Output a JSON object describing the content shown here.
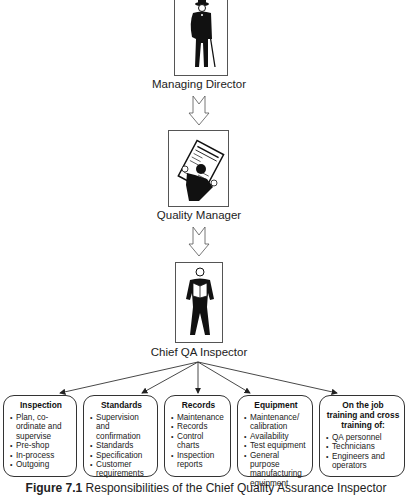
{
  "diagram": {
    "type": "organizational-hierarchy",
    "roles": [
      {
        "id": "managing-director",
        "label": "Managing Director",
        "icon": "man-with-cane-icon"
      },
      {
        "id": "quality-manager",
        "label": "Quality Manager",
        "icon": "man-reading-newspaper-icon"
      },
      {
        "id": "chief-qa-inspector",
        "label": "Chief QA Inspector",
        "icon": "man-reading-book-icon"
      }
    ],
    "responsibilities": [
      {
        "title": "Inspection",
        "items": [
          "Plan, co-ordinate and supervise",
          "Pre-shop",
          "In-process",
          "Outgoing"
        ]
      },
      {
        "title": "Standards",
        "items": [
          "Supervision and confirmation",
          "Standards",
          "Specification",
          "Customer requirements"
        ]
      },
      {
        "title": "Records",
        "items": [
          "Maintenance",
          "Records",
          "Control charts",
          "Inspection reports"
        ]
      },
      {
        "title": "Equipment",
        "items": [
          "Maintenance/ calibration",
          "Availability",
          "Test equipment",
          "General purpose manufacturing equipment"
        ]
      },
      {
        "title": "On the job training and cross training of:",
        "items": [
          "QA personnel",
          "Technicians",
          "Engineers and operators"
        ]
      }
    ],
    "caption": {
      "figure_label": "Figure 7.1",
      "text": "Responsibilities of the Chief Quality Assurance Inspector"
    }
  }
}
